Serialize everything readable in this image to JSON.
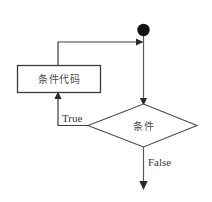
{
  "diagram": {
    "type": "flowchart",
    "title": "",
    "nodes": [
      {
        "id": "start",
        "shape": "filled-circle",
        "label": ""
      },
      {
        "id": "process",
        "shape": "rectangle",
        "label": "条件代码"
      },
      {
        "id": "decision",
        "shape": "diamond",
        "label": "条件"
      }
    ],
    "edges": [
      {
        "id": "start-to-decision",
        "from": "start",
        "to": "decision",
        "label": ""
      },
      {
        "id": "decision-true",
        "from": "decision",
        "to": "process",
        "label": "True"
      },
      {
        "id": "process-to-loop",
        "from": "process",
        "to": "start-to-decision",
        "label": ""
      },
      {
        "id": "decision-false",
        "from": "decision",
        "to": "end",
        "label": "False"
      }
    ]
  },
  "colors": {
    "background": "#ffffff",
    "stroke": "#3a3a3a",
    "line": "#5a5a5a",
    "node_fill": "#111111",
    "text": "#4b4b4b"
  }
}
